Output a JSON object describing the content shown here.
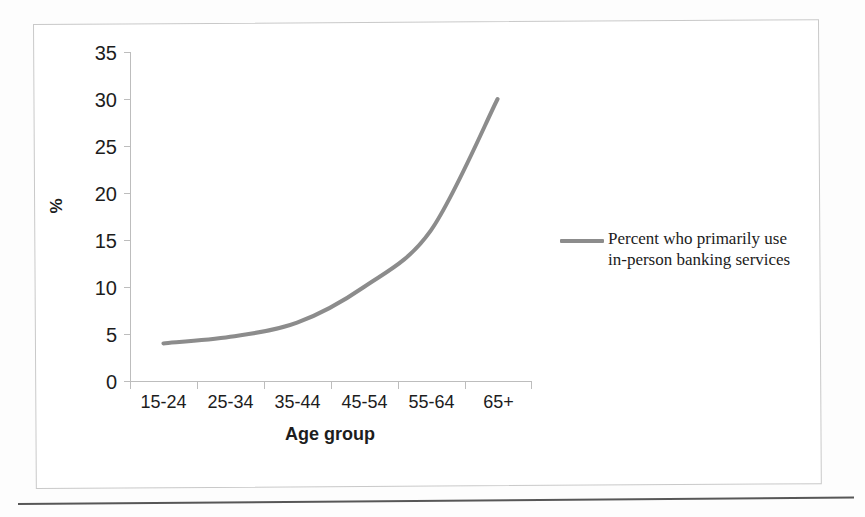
{
  "chart_data": {
    "type": "line",
    "title": "",
    "subtitle": "",
    "xlabel": "Age group",
    "ylabel": "%",
    "categories": [
      "15-24",
      "25-34",
      "35-44",
      "45-54",
      "55-64",
      "65+"
    ],
    "series": [
      {
        "name": "Percent who primarily use in-person banking services",
        "values": [
          4,
          4.7,
          6.2,
          10,
          16,
          30
        ],
        "color": "#8c8c8c",
        "smooth": true
      }
    ],
    "ylim": [
      0,
      35
    ],
    "yticks": [
      0,
      5,
      10,
      15,
      20,
      25,
      30,
      35
    ],
    "ytick_labels": [
      "0",
      "5",
      "10",
      "15",
      "20",
      "25",
      "30",
      "35"
    ],
    "grid": false,
    "legend_position": "right",
    "legend_entries": [
      {
        "label_line1": "Percent who primarily use",
        "label_line2": "in-person banking services",
        "color": "#8c8c8c"
      }
    ]
  },
  "legend": {
    "text": "Percent who primarily use\nin-person banking services"
  },
  "axes": {
    "x_title": "Age group",
    "y_title": "%"
  },
  "colors": {
    "series": "#8c8c8c",
    "axis": "#bdbdbd",
    "text": "#1d1d1d",
    "frame": "#c9c9c9",
    "rule": "#3a3a3a"
  }
}
